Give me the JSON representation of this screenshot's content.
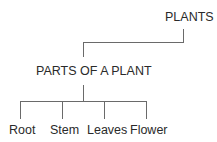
{
  "diagram": {
    "root": {
      "label": "PLANTS"
    },
    "middle": {
      "label": "PARTS OF A PLANT"
    },
    "leaves": [
      {
        "label": "Root"
      },
      {
        "label": "Stem"
      },
      {
        "label": "Leaves"
      },
      {
        "label": "Flower"
      }
    ],
    "line_color": "#6a6a6a",
    "text_color": "#2a2a2a"
  }
}
